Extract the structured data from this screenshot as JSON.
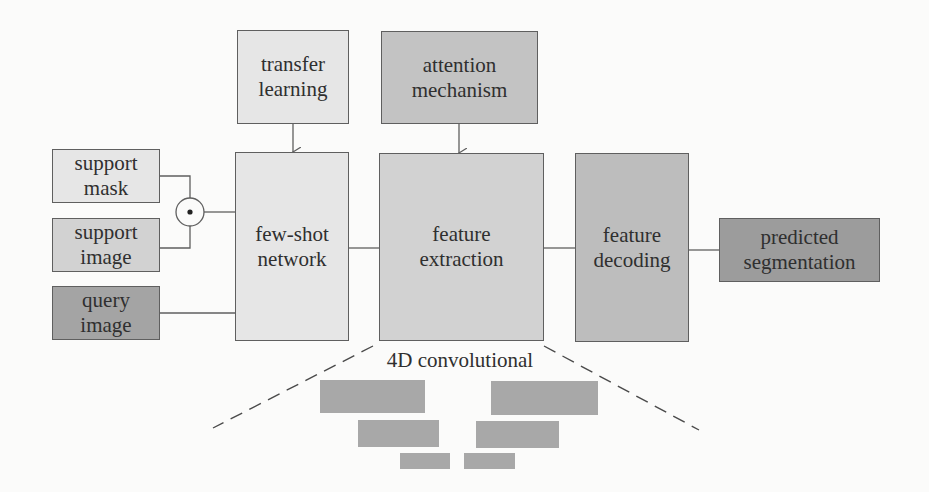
{
  "diagram": {
    "inputs": {
      "support_mask": "support\nmask",
      "support_image": "support\nimage",
      "query_image": "query\nimage"
    },
    "operator": {
      "symbol": "element-wise-product",
      "glyph": "⊙"
    },
    "modules": {
      "transfer_learning": "transfer\nlearning",
      "attention_mechanism": "attention\nmechanism",
      "few_shot_network": "few-shot\nnetwork",
      "feature_extraction": "feature\nextraction",
      "feature_decoding": "feature\ndecoding"
    },
    "output": {
      "predicted_segmentation": "predicted\nsegmentation"
    },
    "detail": {
      "label": "4D convolutional",
      "layers": 3
    },
    "colors": {
      "light": "#e6e6e6",
      "mid": "#d2d2d2",
      "mid_dark": "#c3c3c3",
      "dark": "#a4a4a4",
      "stroke": "#5f5f5f"
    }
  }
}
